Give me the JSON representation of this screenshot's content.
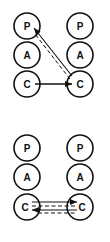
{
  "diagrams": [
    {
      "name": "top",
      "left_column": [
        "P",
        "A",
        "C"
      ],
      "right_column": [
        "P",
        "A",
        "C"
      ]
    },
    {
      "name": "bottom",
      "left_column": [
        "P",
        "A",
        "C"
      ],
      "right_column": [
        "P",
        "A",
        "C"
      ]
    }
  ],
  "colors": {
    "stroke": "#111111",
    "background": "#ffffff"
  }
}
